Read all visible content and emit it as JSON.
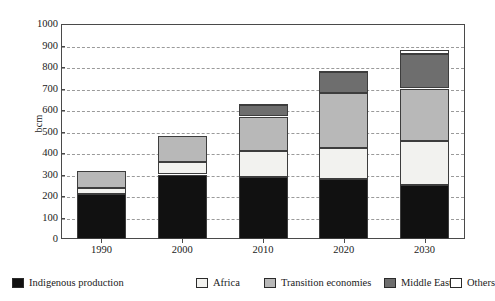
{
  "chart_data": {
    "type": "bar",
    "subtype": "stacked-vertical",
    "title": "",
    "subtitle": "",
    "xlabel": "",
    "ylabel": "bcm",
    "categories": [
      "1990",
      "2000",
      "2010",
      "2020",
      "2030"
    ],
    "ylim": [
      0,
      1000
    ],
    "yticks": [
      0,
      100,
      200,
      300,
      400,
      500,
      600,
      700,
      800,
      900,
      1000
    ],
    "ytick_labels": [
      "0",
      "100",
      "200",
      "300",
      "400",
      "500",
      "600",
      "700",
      "800",
      "900",
      "1000"
    ],
    "grid": true,
    "grid_axis": "y",
    "grid_style": "dashed",
    "legend_position": "bottom",
    "series": [
      {
        "name": "Indigenous production",
        "color": "#111111",
        "values": [
          208,
          300,
          288,
          278,
          252
        ]
      },
      {
        "name": "Africa",
        "color": "#f2f2ef",
        "values": [
          30,
          60,
          122,
          147,
          206
        ]
      },
      {
        "name": "Transition economies",
        "color": "#b8b8b8",
        "values": [
          77,
          118,
          160,
          253,
          242
        ]
      },
      {
        "name": "Middle East",
        "color": "#6e6e6e",
        "values": [
          0,
          0,
          55,
          97,
          162
        ]
      },
      {
        "name": "Others",
        "color": "#ffffff",
        "values": [
          0,
          0,
          5,
          8,
          16
        ]
      }
    ],
    "totals": [
      315,
      478,
      630,
      783,
      878
    ]
  },
  "legend": {
    "items": [
      {
        "label": "Indigenous production",
        "color": "#111111"
      },
      {
        "label": "Africa",
        "color": "#f2f2ef"
      },
      {
        "label": "Transition economies",
        "color": "#b8b8b8"
      },
      {
        "label": "Middle East",
        "color": "#6e6e6e"
      },
      {
        "label": "Others",
        "color": "#ffffff"
      }
    ]
  },
  "colors": {
    "axis": "#4a4a4a",
    "grid": "#9a9a9a",
    "text": "#1a1a1a",
    "background": "#ffffff"
  }
}
